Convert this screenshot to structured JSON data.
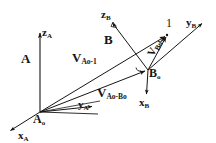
{
  "figure": {
    "background": "#ffffff",
    "ink": "#151515"
  },
  "labels": {
    "frame_a": "A",
    "frame_b": "B",
    "origin_a": "A",
    "origin_a_sub": "o",
    "origin_b": "B",
    "origin_b_sub": "o",
    "point_1": "1",
    "x_a": "x",
    "x_a_sub": "A",
    "y_a": "y",
    "y_a_sub": "A",
    "z_a": "z",
    "z_a_sub": "A",
    "x_b": "x",
    "x_b_sub": "B",
    "y_b": "y",
    "y_b_sub": "B",
    "z_b": "z",
    "z_b_sub": "B",
    "v_ao_1": "V",
    "v_ao_1_sub": "Ao-1",
    "v_ao_bo": "V",
    "v_ao_bo_sub": "Ao-Bo",
    "v_bo_1": "V",
    "v_bo_1_sub": "Bo-1"
  },
  "geometry": {
    "origin_a": [
      40,
      112
    ],
    "origin_b": [
      148,
      70
    ],
    "point_1": [
      168,
      34
    ],
    "z_a_tip": [
      40,
      32
    ],
    "x_a_tip": [
      9,
      132
    ],
    "y_a_tip": [
      95,
      108
    ],
    "y_a_tip2": [
      99,
      114
    ],
    "z_b_tip": [
      111,
      21
    ],
    "x_b_tip": [
      146,
      97
    ],
    "y_b_tip": [
      204,
      22
    ]
  }
}
